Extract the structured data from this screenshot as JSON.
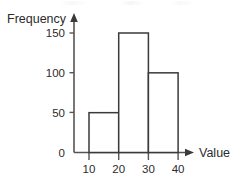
{
  "chart_data": {
    "type": "bar",
    "title": "",
    "subtitle": "",
    "xlabel": "Value",
    "ylabel": "Frequency",
    "categories": [
      "10-20",
      "20-30",
      "30-40"
    ],
    "bin_edges": [
      10,
      20,
      30,
      40
    ],
    "values": [
      50,
      150,
      100
    ],
    "bars": [
      {
        "label": "10-20",
        "start": 10,
        "end": 20,
        "value": 50
      },
      {
        "label": "20-30",
        "start": 20,
        "end": 30,
        "value": 150
      },
      {
        "label": "30-40",
        "start": 30,
        "end": 40,
        "value": 100
      }
    ],
    "xlim": [
      0,
      45
    ],
    "ylim": [
      0,
      165
    ],
    "x_ticks": [
      10,
      20,
      30,
      40
    ],
    "x_tick_labels": [
      "10",
      "20",
      "30",
      "40"
    ],
    "y_ticks": [
      0,
      50,
      100,
      150
    ],
    "y_tick_labels": [
      "0",
      "50",
      "100",
      "150"
    ],
    "grid": false,
    "legend": false,
    "legend_position": "none",
    "bar_fill": "#ffffff",
    "bar_stroke": "#3a3a3a",
    "axis_color": "#555555",
    "text_color": "#2b2b2b",
    "background": "#ffffff",
    "axis_arrows": true
  },
  "axes": {
    "y_title": "Frequency",
    "x_title": "Value"
  },
  "ticks": {
    "y": [
      {
        "value": 150,
        "label": "150"
      },
      {
        "value": 100,
        "label": "100"
      },
      {
        "value": 50,
        "label": "50"
      },
      {
        "value": 0,
        "label": "0"
      }
    ],
    "x": [
      {
        "value": 10,
        "label": "10"
      },
      {
        "value": 20,
        "label": "20"
      },
      {
        "value": 30,
        "label": "30"
      },
      {
        "value": 40,
        "label": "40"
      }
    ]
  }
}
